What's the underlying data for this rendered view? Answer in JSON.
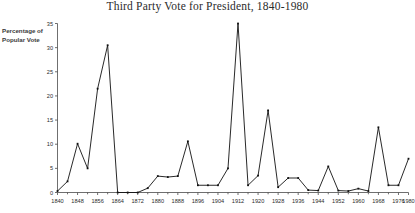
{
  "chart_data": {
    "type": "line",
    "title": "Third Party Vote for President, 1840-1980",
    "xlabel": "",
    "ylabel": "Percentage of Popular Vote",
    "ylabel_lines": [
      "Percentage of",
      "Popular Vote"
    ],
    "ylim": [
      0,
      35
    ],
    "xlim": [
      1840,
      1980
    ],
    "ytick_labels": [
      "0",
      "5",
      "10",
      "15",
      "20",
      "25",
      "30",
      "35"
    ],
    "ytick_values": [
      0,
      5,
      10,
      15,
      20,
      25,
      30,
      35
    ],
    "xtick_labels": [
      "1840",
      "1848",
      "1856",
      "1864",
      "1872",
      "1880",
      "1888",
      "1896",
      "1904",
      "1912",
      "1920",
      "1928",
      "1936",
      "1944",
      "1952",
      "1960",
      "1968",
      "1976",
      "1980"
    ],
    "xtick_values": [
      1840,
      1848,
      1856,
      1864,
      1872,
      1880,
      1888,
      1896,
      1904,
      1912,
      1920,
      1928,
      1936,
      1944,
      1952,
      1960,
      1968,
      1976,
      1980
    ],
    "minor_xticks": [
      1844,
      1852,
      1860,
      1868,
      1876,
      1884,
      1892,
      1900,
      1908,
      1916,
      1924,
      1932,
      1940,
      1948,
      1956,
      1964,
      1972
    ],
    "grid": false,
    "legend": null,
    "markers": true,
    "line_color": "#111111",
    "axis_color": "#4a4a4a",
    "x": [
      1840,
      1844,
      1848,
      1852,
      1856,
      1860,
      1864,
      1868,
      1872,
      1876,
      1880,
      1884,
      1888,
      1892,
      1896,
      1900,
      1904,
      1908,
      1912,
      1916,
      1920,
      1924,
      1928,
      1932,
      1936,
      1940,
      1944,
      1948,
      1952,
      1956,
      1960,
      1964,
      1968,
      1972,
      1976,
      1980
    ],
    "values": [
      0.3,
      2.3,
      10.1,
      5.0,
      21.5,
      30.5,
      0.0,
      0.0,
      0.0,
      0.9,
      3.4,
      3.2,
      3.4,
      10.6,
      1.5,
      1.5,
      1.5,
      5.0,
      35.0,
      1.5,
      3.5,
      17.0,
      1.1,
      3.0,
      3.0,
      0.5,
      0.4,
      5.4,
      0.4,
      0.3,
      0.8,
      0.3,
      13.5,
      1.5,
      1.5,
      7.0
    ]
  }
}
